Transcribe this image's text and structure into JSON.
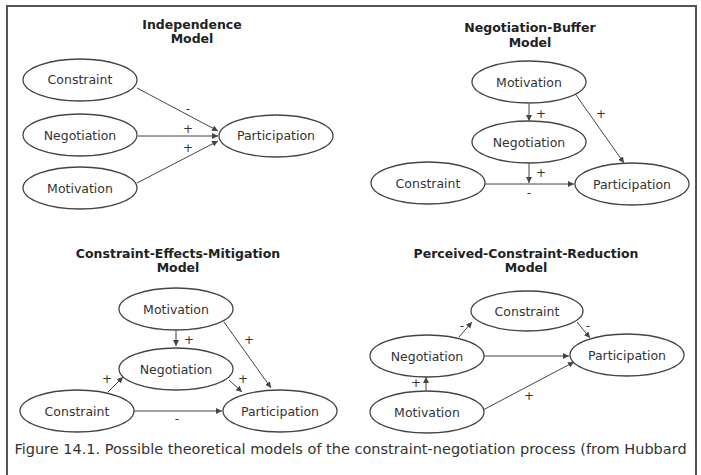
{
  "figure": {
    "caption": "Figure 14.1. Possible theoretical models of the constraint-negotiation process (from Hubbard",
    "border_color": "#555555",
    "line_color": "#444444"
  },
  "models": [
    {
      "title_line1": "Independence",
      "title_line2": "Model",
      "nodes": {
        "constraint": "Constraint",
        "negotiation": "Negotiation",
        "motivation": "Motivation",
        "participation": "Participation"
      },
      "edges": [
        {
          "from": "Constraint",
          "to": "Participation",
          "sign": "-"
        },
        {
          "from": "Negotiation",
          "to": "Participation",
          "sign": "+"
        },
        {
          "from": "Motivation",
          "to": "Participation",
          "sign": "+"
        }
      ]
    },
    {
      "title_line1": "Negotiation-Buffer",
      "title_line2": "Model",
      "nodes": {
        "motivation": "Motivation",
        "negotiation": "Negotiation",
        "constraint": "Constraint",
        "participation": "Participation"
      },
      "edges": [
        {
          "from": "Motivation",
          "to": "Negotiation",
          "sign": "+"
        },
        {
          "from": "Motivation",
          "to": "Participation",
          "sign": "+"
        },
        {
          "from": "Negotiation",
          "to": "Constraint-Participation path",
          "sign": "+"
        },
        {
          "from": "Constraint",
          "to": "Participation",
          "sign": "-"
        }
      ]
    },
    {
      "title_line1": "Constraint-Effects-Mitigation",
      "title_line2": "Model",
      "nodes": {
        "motivation": "Motivation",
        "negotiation": "Negotiation",
        "constraint": "Constraint",
        "participation": "Participation"
      },
      "edges": [
        {
          "from": "Motivation",
          "to": "Negotiation",
          "sign": "+"
        },
        {
          "from": "Motivation",
          "to": "Participation",
          "sign": "+"
        },
        {
          "from": "Constraint",
          "to": "Negotiation",
          "sign": "+"
        },
        {
          "from": "Negotiation",
          "to": "Participation",
          "sign": "+"
        },
        {
          "from": "Constraint",
          "to": "Participation",
          "sign": "-"
        }
      ]
    },
    {
      "title_line1": "Perceived-Constraint-Reduction",
      "title_line2": "Model",
      "nodes": {
        "constraint": "Constraint",
        "negotiation": "Negotiation",
        "motivation": "Motivation",
        "participation": "Participation"
      },
      "edges": [
        {
          "from": "Negotiation",
          "to": "Constraint",
          "sign": "-"
        },
        {
          "from": "Constraint",
          "to": "Participation",
          "sign": "-"
        },
        {
          "from": "Negotiation",
          "to": "Participation",
          "sign": ""
        },
        {
          "from": "Motivation",
          "to": "Negotiation",
          "sign": "+"
        },
        {
          "from": "Motivation",
          "to": "Participation",
          "sign": "+"
        }
      ]
    }
  ]
}
